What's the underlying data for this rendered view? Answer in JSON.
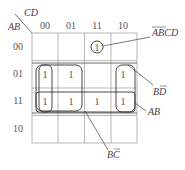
{
  "kmap": {
    "row_var": "AB",
    "col_var": "CD",
    "col_labels": [
      "00",
      "01",
      "11",
      "10"
    ],
    "row_labels": [
      "00",
      "01",
      "11",
      "10"
    ],
    "cells": [
      [
        "",
        "",
        "1",
        ""
      ],
      [
        "1",
        "1",
        "",
        "1"
      ],
      [
        "1",
        "1",
        "1",
        "1"
      ],
      [
        "",
        "",
        "",
        ""
      ]
    ],
    "groups": {
      "a_bar_b_bar_c_d": {
        "label": "ĀB̄CD",
        "base": "ABCD"
      },
      "b_d_bar": {
        "label": "BD̄",
        "base": "BD"
      },
      "ab": {
        "label": "AB"
      },
      "b_c_bar": {
        "label": "BC̄",
        "base": "BC"
      }
    }
  },
  "colors": {
    "grid": "#888888",
    "loop": "#333333",
    "text": "#444444"
  }
}
